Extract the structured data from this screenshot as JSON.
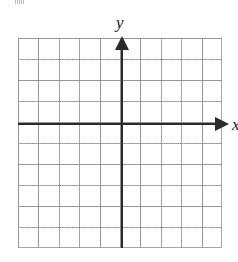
{
  "figure": {
    "name": "blank-cartesian-coordinate-grid",
    "background_color": "#ffffff"
  },
  "axes": {
    "x": {
      "label": "x",
      "color": "#2b2b2b",
      "arrow": "arrow-right",
      "orientation": "horizontal"
    },
    "y": {
      "label": "y",
      "color": "#2b2b2b",
      "arrow": "arrow-up",
      "orientation": "vertical"
    }
  },
  "grid": {
    "color": "#969696",
    "style": "dotted",
    "columns": 10,
    "rows": 10,
    "cell_width_px": 20.4,
    "cell_height_px": 21,
    "border": true,
    "tick_labels": [],
    "origin_column_from_left": 5,
    "origin_row_from_top": 4
  },
  "chart_data": {
    "type": "scatter",
    "title": "",
    "xlabel": "x",
    "ylabel": "y",
    "x": [],
    "y": [],
    "series": [],
    "xlim": [
      -5,
      5
    ],
    "ylim": [
      -6,
      4
    ],
    "grid": true,
    "legend": "none",
    "annotations": []
  },
  "artifacts": {
    "top_left_mark": ""
  }
}
